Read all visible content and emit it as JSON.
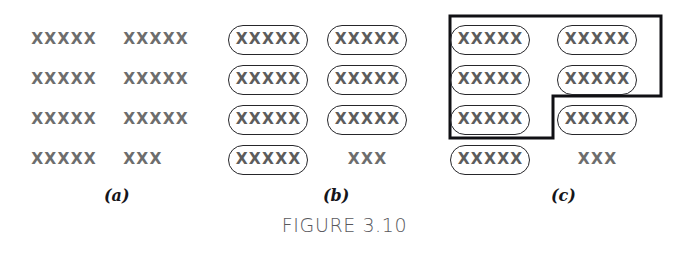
{
  "figure": {
    "caption": "FIGURE 3.10",
    "marker_glyph": "X",
    "colors": {
      "mark": "#6d6d6d",
      "oval_stroke": "#26262a",
      "boundary_stroke": "#101014",
      "caption": "#58585c",
      "background": "#ffffff"
    }
  },
  "panels": [
    {
      "id": "a",
      "letter": "(a)",
      "rows": [
        {
          "left": "XXXXX",
          "right": "XXXXX",
          "left_circled": false,
          "right_circled": false
        },
        {
          "left": "XXXXX",
          "right": "XXXXX",
          "left_circled": false,
          "right_circled": false
        },
        {
          "left": "XXXXX",
          "right": "XXXXX",
          "left_circled": false,
          "right_circled": false
        },
        {
          "left": "XXXXX",
          "right": "XXX",
          "left_circled": false,
          "right_circled": false
        }
      ]
    },
    {
      "id": "b",
      "letter": "(b)",
      "rows": [
        {
          "left": "XXXXX",
          "right": "XXXXX",
          "left_circled": true,
          "right_circled": true
        },
        {
          "left": "XXXXX",
          "right": "XXXXX",
          "left_circled": true,
          "right_circled": true
        },
        {
          "left": "XXXXX",
          "right": "XXXXX",
          "left_circled": true,
          "right_circled": true
        },
        {
          "left": "XXXXX",
          "right": "XXX",
          "left_circled": true,
          "right_circled": false
        }
      ]
    },
    {
      "id": "c",
      "letter": "(c)",
      "rows": [
        {
          "left": "XXXXX",
          "right": "XXXXX",
          "left_circled": true,
          "right_circled": true
        },
        {
          "left": "XXXXX",
          "right": "XXXXX",
          "left_circled": true,
          "right_circled": true
        },
        {
          "left": "XXXXX",
          "right": "XXXXX",
          "left_circled": true,
          "right_circled": true
        },
        {
          "left": "XXXXX",
          "right": "XXX",
          "left_circled": true,
          "right_circled": false
        }
      ],
      "boundary": {
        "shape": "step-polygon",
        "encloses": 5,
        "points": "10,16 221,16 221,96 113,96 113,138 10,138"
      }
    }
  ]
}
